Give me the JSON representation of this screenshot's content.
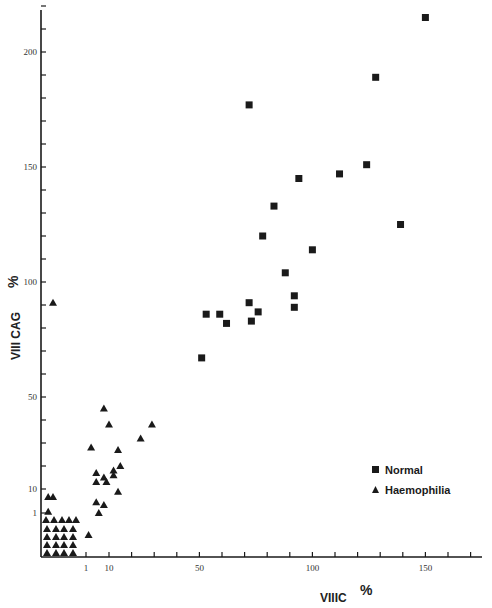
{
  "chart_data": {
    "type": "scatter",
    "title": "",
    "xlabel": "VIIIC %",
    "ylabel": "VIII CAG %",
    "x_ticks": [
      {
        "value": 1,
        "label": "1"
      },
      {
        "value": 10,
        "label": "10"
      },
      {
        "value": 20,
        "label": ""
      },
      {
        "value": 30,
        "label": ""
      },
      {
        "value": 40,
        "label": ""
      },
      {
        "value": 50,
        "label": "50"
      },
      {
        "value": 60,
        "label": ""
      },
      {
        "value": 70,
        "label": ""
      },
      {
        "value": 80,
        "label": ""
      },
      {
        "value": 90,
        "label": ""
      },
      {
        "value": 100,
        "label": "100"
      },
      {
        "value": 110,
        "label": ""
      },
      {
        "value": 120,
        "label": ""
      },
      {
        "value": 130,
        "label": ""
      },
      {
        "value": 140,
        "label": ""
      },
      {
        "value": 150,
        "label": "150"
      },
      {
        "value": 160,
        "label": ""
      },
      {
        "value": 170,
        "label": ""
      }
    ],
    "y_ticks": [
      {
        "value": 1,
        "label": "1"
      },
      {
        "value": 10,
        "label": "10"
      },
      {
        "value": 20,
        "label": ""
      },
      {
        "value": 30,
        "label": ""
      },
      {
        "value": 40,
        "label": ""
      },
      {
        "value": 50,
        "label": "50"
      },
      {
        "value": 60,
        "label": ""
      },
      {
        "value": 70,
        "label": ""
      },
      {
        "value": 80,
        "label": ""
      },
      {
        "value": 90,
        "label": ""
      },
      {
        "value": 100,
        "label": "100"
      },
      {
        "value": 110,
        "label": ""
      },
      {
        "value": 120,
        "label": ""
      },
      {
        "value": 130,
        "label": ""
      },
      {
        "value": 140,
        "label": ""
      },
      {
        "value": 150,
        "label": "150"
      },
      {
        "value": 160,
        "label": ""
      },
      {
        "value": 170,
        "label": ""
      },
      {
        "value": 180,
        "label": ""
      },
      {
        "value": 190,
        "label": ""
      },
      {
        "value": 200,
        "label": "200"
      },
      {
        "value": 210,
        "label": ""
      },
      {
        "value": 220,
        "label": ""
      }
    ],
    "xlim": [
      0,
      175
    ],
    "ylim": [
      0,
      225
    ],
    "grid": false,
    "legend_position": "lower right",
    "series": [
      {
        "name": "Normal",
        "marker": "square",
        "color": "#1a1a1a",
        "points": [
          {
            "x": 150,
            "y": 215
          },
          {
            "x": 128,
            "y": 189
          },
          {
            "x": 72,
            "y": 177
          },
          {
            "x": 124,
            "y": 151
          },
          {
            "x": 112,
            "y": 147
          },
          {
            "x": 94,
            "y": 145
          },
          {
            "x": 83,
            "y": 133
          },
          {
            "x": 139,
            "y": 125
          },
          {
            "x": 78,
            "y": 120
          },
          {
            "x": 100,
            "y": 114
          },
          {
            "x": 88,
            "y": 104
          },
          {
            "x": 92,
            "y": 94
          },
          {
            "x": 72,
            "y": 91
          },
          {
            "x": 92,
            "y": 89
          },
          {
            "x": 76,
            "y": 87
          },
          {
            "x": 53,
            "y": 86
          },
          {
            "x": 59,
            "y": 86
          },
          {
            "x": 73,
            "y": 83
          },
          {
            "x": 62,
            "y": 82
          },
          {
            "x": 51,
            "y": 67
          }
        ]
      },
      {
        "name": "Haemophilia",
        "marker": "triangle",
        "color": "#1a1a1a",
        "points": [
          {
            "x": 0.5,
            "y": 91
          },
          {
            "x": 8,
            "y": 45
          },
          {
            "x": 10,
            "y": 38
          },
          {
            "x": 29,
            "y": 38
          },
          {
            "x": 24,
            "y": 32
          },
          {
            "x": 3,
            "y": 28
          },
          {
            "x": 14,
            "y": 27
          },
          {
            "x": 15,
            "y": 20
          },
          {
            "x": 12,
            "y": 18
          },
          {
            "x": 5,
            "y": 17
          },
          {
            "x": 12,
            "y": 16
          },
          {
            "x": 8,
            "y": 15
          },
          {
            "x": 5,
            "y": 13
          },
          {
            "x": 9,
            "y": 13
          },
          {
            "x": 14,
            "y": 9
          },
          {
            "x": 5,
            "y": 5
          },
          {
            "x": 8,
            "y": 4
          },
          {
            "x": 6,
            "y": 1
          },
          {
            "x": 2,
            "y": 0.5
          },
          {
            "x": 0.2,
            "y": 7
          },
          {
            "x": 0.5,
            "y": 7
          },
          {
            "x": 0.2,
            "y": 1.5
          }
        ],
        "low_cluster": {
          "description": "dense grid of values <1% for both factors",
          "rows": 5,
          "count": 21,
          "x_range": "<1",
          "y_range": "<1"
        }
      }
    ]
  },
  "legend": {
    "items": [
      {
        "label": "Normal",
        "marker": "square"
      },
      {
        "label": "Haemophilia",
        "marker": "triangle"
      }
    ]
  },
  "axes": {
    "x_title_main": "VIIIC",
    "x_title_unit": "%",
    "y_title_main": "VIII  CAG",
    "y_title_unit": "%"
  }
}
